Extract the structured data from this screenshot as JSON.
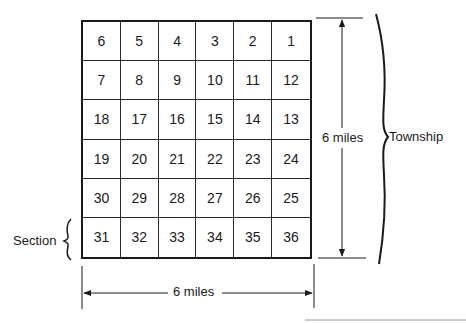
{
  "diagram": {
    "title": "",
    "grid": {
      "rows": 6,
      "cols": 6,
      "cells": [
        [
          6,
          5,
          4,
          3,
          2,
          1
        ],
        [
          7,
          8,
          9,
          10,
          11,
          12
        ],
        [
          18,
          17,
          16,
          15,
          14,
          13
        ],
        [
          19,
          20,
          21,
          22,
          23,
          24
        ],
        [
          30,
          29,
          28,
          27,
          26,
          25
        ],
        [
          31,
          32,
          33,
          34,
          35,
          36
        ]
      ]
    },
    "labels": {
      "vertical_dimension": "6 miles",
      "horizontal_dimension": "6 miles",
      "township": "Township",
      "section": "Section"
    },
    "colors": {
      "line": "#1a1a1a",
      "background": "#ffffff"
    }
  }
}
